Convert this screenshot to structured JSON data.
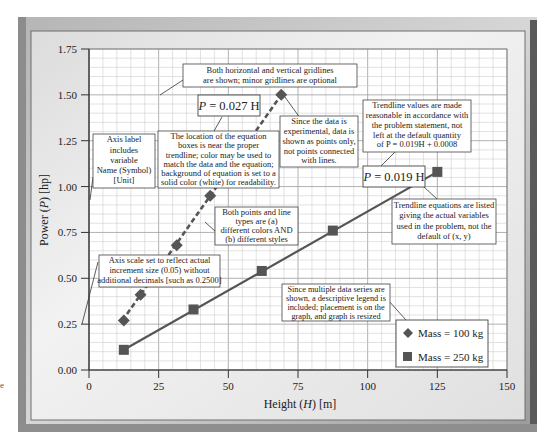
{
  "chart_data": {
    "type": "scatter",
    "title": "",
    "xlabel": "Height (H) [m]",
    "ylabel": "Power (P) [hp]",
    "xlim": [
      0,
      150
    ],
    "ylim": [
      0,
      1.75
    ],
    "x_ticks": [
      "0",
      "25",
      "50",
      "75",
      "100",
      "125",
      "150"
    ],
    "y_ticks": [
      "0.00",
      "0.25",
      "0.50",
      "0.75",
      "1.00",
      "1.25",
      "1.50",
      "1.75"
    ],
    "grid": {
      "major": true,
      "minor": true,
      "x_minor_step": 5,
      "y_minor_step": 0.05
    },
    "legend_position": "lower-right inside plot",
    "series": [
      {
        "name": "Mass = 100 kg",
        "marker": "diamond",
        "trendline_style": "dashed",
        "trendline_equation": "P = 0.027 H",
        "x": [
          12.5,
          18.5,
          31.5,
          43.5,
          69
        ],
        "y": [
          0.27,
          0.41,
          0.68,
          0.95,
          1.5
        ]
      },
      {
        "name": "Mass = 250 kg",
        "marker": "square",
        "trendline_style": "solid",
        "trendline_equation": "P = 0.019 H",
        "x": [
          12.5,
          37.5,
          62,
          87.5,
          125
        ],
        "y": [
          0.11,
          0.33,
          0.54,
          0.76,
          1.08
        ]
      }
    ],
    "annotations": [
      "Both horizontal and vertical gridlines are shown; minor gridlines are optional",
      "The location of the equation boxes is near the proper trendline; color may be used to match the data and the equation; background of equation is set to a solid color (white) for readability.",
      "Since the data is experimental, data is shown as points only, not points connected with lines.",
      "Trendline values are made reasonable in accordance with the problem statement, not left at the default quantity of P = 0.019H + 0.0008",
      "Trendline equations are listed giving the actual variables used in the problem, not the default of (x, y)",
      "Axis label includes variable Name (Symbol) [Unit]",
      "Both points and line types are (a) different colors AND (b) different styles",
      "Axis scale set to reflect actual increment size (0.05) without additional decimals [such as 0.2500]",
      "Since multiple data series are shown, a descriptive legend is included; placement is on the graph, and graph is resized"
    ]
  },
  "colors": {
    "series_color": "#555555",
    "grid_major": "#a8a8a8",
    "grid_minor": "#cfcfcf",
    "frame_dark": "#7a7a7a",
    "frame_light": "#d9d9d9"
  },
  "axes": {
    "ylabel_prefix": "Power (",
    "ylabel_symbol": "P",
    "ylabel_suffix": ") [hp]",
    "xlabel_prefix": "Height (",
    "xlabel_symbol": "H",
    "xlabel_suffix": ") [m]"
  },
  "equations": {
    "eq100": "P = 0.027 H",
    "eq250": "P = 0.019 H"
  },
  "legend": {
    "items": [
      "Mass = 100 kg",
      "Mass = 250 kg"
    ]
  },
  "notes": {
    "gridlines": [
      "Both horizontal and vertical gridlines",
      "are shown; minor gridlines are optional"
    ],
    "location": [
      "The location of the equation",
      "boxes is near the proper",
      "trendline; color may be used to",
      "match the data and the equation;",
      "background of equation is set to a",
      "solid color (white) for readability."
    ],
    "experimental": [
      "Since the data is",
      "experimental, data is",
      "shown as points only,",
      "not points connected",
      "with lines."
    ],
    "trendline_values": [
      "Trendline values are made",
      "reasonable in accordance with",
      "the problem statement, not",
      "left at the default quantity",
      "of P = 0.019H + 0.0008"
    ],
    "trendline_eq": [
      "Trendline equations are listed",
      "giving the actual variables",
      "used in the problem, not the",
      "default of (x, y)"
    ],
    "axis_label": [
      "Axis label",
      "includes",
      "variable",
      "Name (Symbol)",
      "[Unit]"
    ],
    "styles": [
      "Both points and line",
      "types are (a)",
      "different colors AND",
      "(b) different styles"
    ],
    "axis_scale": [
      "Axis scale set to reflect actual",
      "increment size (0.05) without",
      "additional decimals [such as 0.2500]"
    ],
    "legend_note": [
      "Since multiple data series are",
      "shown, a descriptive legend is",
      "included; placement is on the",
      "graph, and graph is resized"
    ]
  },
  "margin_mark": "e"
}
